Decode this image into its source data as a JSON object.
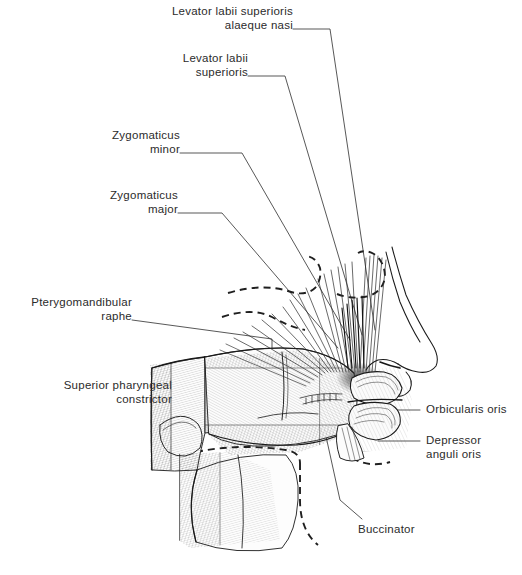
{
  "figure": {
    "type": "anatomical-illustration",
    "background_color": "#ffffff",
    "line_color": "#1a1a1a",
    "text_color": "#2b2b2b"
  },
  "labels": {
    "levator_labii_superioris_alaeque_nasi": "Levator labii superioris\nalaeque nasi",
    "levator_labii_superioris": "Levator labii\nsuperioris",
    "zygomaticus_minor": "Zygomaticus\nminor",
    "zygomaticus_major": "Zygomaticus\nmajor",
    "pterygomandibular_raphe": "Pterygomandibular\nraphe",
    "superior_pharyngeal_constrictor": "Superior pharyngeal\nconstrictor",
    "orbicularis_oris": "Orbicularis oris",
    "depressor_anguli_oris": "Depressor\nanguli oris",
    "buccinator": "Buccinator"
  }
}
